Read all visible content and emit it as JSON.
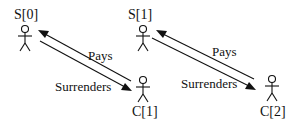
{
  "diagram": {
    "actors": [
      {
        "id": "S0",
        "label": "S[0]"
      },
      {
        "id": "C1",
        "label": "C[1]"
      },
      {
        "id": "S1",
        "label": "S[1]"
      },
      {
        "id": "C2",
        "label": "C[2]"
      }
    ],
    "relations": [
      {
        "from": "C[1]",
        "to": "S[0]",
        "label": "Pays"
      },
      {
        "from": "S[0]",
        "to": "C[1]",
        "label": "Surrenders"
      },
      {
        "from": "C[2]",
        "to": "S[1]",
        "label": "Pays"
      },
      {
        "from": "S[1]",
        "to": "C[2]",
        "label": "Surrenders"
      }
    ]
  }
}
